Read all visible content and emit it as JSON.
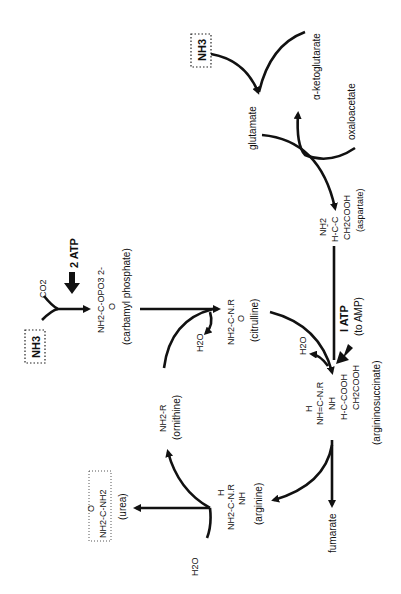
{
  "diagram": {
    "orientation": "rotated 90 degrees counter-clockwise",
    "inputs": {
      "ammonia_top": "NH3",
      "ammonia_left": "NH3",
      "co2": "CO2",
      "atp_carbamyl": "2 ATP",
      "alpha_ketoglutarate": "α-ketoglutarate",
      "glutamate": "glutamate",
      "oxaloacetate": "oxaloacetate",
      "atp_argsucc_line1": "I ATP",
      "atp_argsucc_line2": "(to AMP)",
      "water_citrulline": "H2O",
      "water_argsucc": "H2O",
      "water_urea": "H2O",
      "fumarate": "fumarate"
    },
    "compounds": {
      "carbamyl_phosphate": {
        "formula": "NH2-C-OPO3 2-",
        "carbonyl": "O",
        "name": "(carbamyl phosphate)"
      },
      "citrulline": {
        "formula": "NH2-C-N.R",
        "carbonyl": "O",
        "name": "(citrulline)"
      },
      "aspartate": {
        "line1": "NH2",
        "line2": "H-C-C",
        "line3": "CH2COOH",
        "name": "(aspartate)"
      },
      "argininosuccinate": {
        "line1": "H",
        "line2": "NH=C-N.R",
        "line3": "NH",
        "line4": "H-C-COOH",
        "line5": "CH2COOH",
        "name": "(argininosuccinate)"
      },
      "arginine": {
        "line1": "H",
        "line2": "NH2-C-N.R",
        "line3": "NH",
        "name": "(arginine)"
      },
      "ornithine": {
        "formula": "NH2-R",
        "name": "(ornithine)"
      },
      "urea": {
        "carbonyl": "O",
        "formula": "NH2-C-NH2",
        "name": "(urea)"
      }
    }
  }
}
